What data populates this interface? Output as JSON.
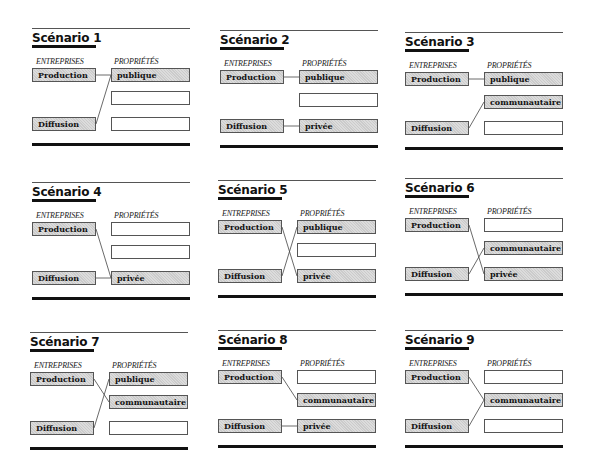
{
  "labels": {
    "entreprises_header": "ENTREPRISES",
    "proprietes_header": "PROPRIÉTÉS",
    "production": "Production",
    "diffusion": "Diffusion"
  },
  "scenarios": [
    {
      "title": "Scénario 1",
      "props": [
        "publique",
        "",
        ""
      ],
      "filled": [
        true,
        false,
        false
      ],
      "links": {
        "production": 0,
        "diffusion": 0
      }
    },
    {
      "title": "Scénario 2",
      "props": [
        "publique",
        "",
        "privée"
      ],
      "filled": [
        true,
        false,
        true
      ],
      "links": {
        "production": 0,
        "diffusion": 2
      }
    },
    {
      "title": "Scénario 3",
      "props": [
        "publique",
        "communautaire",
        ""
      ],
      "filled": [
        true,
        true,
        false
      ],
      "links": {
        "production": 0,
        "diffusion": 1
      }
    },
    {
      "title": "Scénario 4",
      "props": [
        "",
        "",
        "privée"
      ],
      "filled": [
        false,
        false,
        true
      ],
      "links": {
        "production": 2,
        "diffusion": 2
      }
    },
    {
      "title": "Scénario 5",
      "props": [
        "publique",
        "",
        "privée"
      ],
      "filled": [
        true,
        false,
        true
      ],
      "links": {
        "production": 2,
        "diffusion": 0
      }
    },
    {
      "title": "Scénario 6",
      "props": [
        "",
        "communautaire",
        "privée"
      ],
      "filled": [
        false,
        true,
        true
      ],
      "links": {
        "production": 2,
        "diffusion": 1
      }
    },
    {
      "title": "Scénario 7",
      "props": [
        "publique",
        "communautaire",
        ""
      ],
      "filled": [
        true,
        true,
        false
      ],
      "links": {
        "production": 1,
        "diffusion": 0
      }
    },
    {
      "title": "Scénario 8",
      "props": [
        "",
        "communautaire",
        "privée"
      ],
      "filled": [
        false,
        true,
        true
      ],
      "links": {
        "production": 1,
        "diffusion": 2
      }
    },
    {
      "title": "Scénario 9",
      "props": [
        "",
        "communautaire",
        ""
      ],
      "filled": [
        false,
        true,
        false
      ],
      "links": {
        "production": 1,
        "diffusion": 1
      }
    }
  ],
  "colors": {
    "box_fill": "#dcdcdc",
    "line": "#111111"
  }
}
